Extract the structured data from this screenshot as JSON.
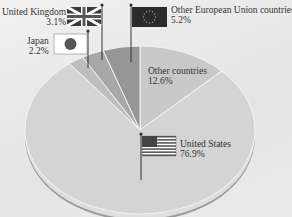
{
  "chart_data": {
    "type": "pie",
    "title": "",
    "slices": [
      {
        "label": "United States",
        "value": 76.9,
        "display": "76.9%",
        "color": "#d4d4d4",
        "flag": "us-flag"
      },
      {
        "label": "Japan",
        "value": 2.2,
        "display": "2.2%",
        "color": "#bdbdbd",
        "flag": "japan-flag"
      },
      {
        "label": "United Kingdom",
        "value": 3.1,
        "display": "3.1%",
        "color": "#a8a8a8",
        "flag": "uk-flag"
      },
      {
        "label": "Other European Union countries",
        "value": 5.2,
        "display": "5.2%",
        "color": "#969696",
        "flag": "eu-flag"
      },
      {
        "label": "Other countries",
        "value": 12.6,
        "display": "12.6%",
        "color": "#c9c9c9",
        "flag": ""
      }
    ]
  }
}
